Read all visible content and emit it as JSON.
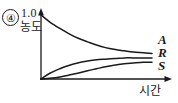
{
  "figure": {
    "option_number": "④",
    "y_axis": {
      "max_value_label": "1.0",
      "title": "농도"
    },
    "x_axis": {
      "title": "시간"
    },
    "curve_labels": {
      "a": "A",
      "r": "R",
      "s": "S"
    },
    "colors": {
      "ink": "#1a1a1a",
      "background": "#ffffff"
    }
  },
  "chart_data": {
    "type": "line",
    "title": "",
    "xlabel": "시간",
    "ylabel": "농도",
    "xlim": [
      0,
      1
    ],
    "ylim": [
      0,
      1
    ],
    "grid": false,
    "legend": "right-of-curve-ends",
    "annotations": [
      "④",
      "1.0"
    ],
    "axis_ticks": {
      "y": [
        "1.0"
      ],
      "x": []
    },
    "series": [
      {
        "name": "A",
        "description": "reactant concentration decaying from 1.0 to a plateau near 0.4",
        "x": [
          0.0,
          0.08,
          0.17,
          0.25,
          0.33,
          0.42,
          0.5,
          0.58,
          0.67,
          0.75,
          0.83,
          0.92,
          1.0
        ],
        "values": [
          1.0,
          0.89,
          0.79,
          0.71,
          0.64,
          0.58,
          0.53,
          0.49,
          0.46,
          0.44,
          0.42,
          0.41,
          0.4
        ]
      },
      {
        "name": "R",
        "description": "intermediate/product rising quickly from 0 to a plateau near 0.33",
        "x": [
          0.0,
          0.08,
          0.17,
          0.25,
          0.33,
          0.42,
          0.5,
          0.58,
          0.67,
          0.75,
          0.83,
          0.92,
          1.0
        ],
        "values": [
          0.0,
          0.09,
          0.16,
          0.21,
          0.25,
          0.28,
          0.3,
          0.31,
          0.32,
          0.33,
          0.33,
          0.33,
          0.33
        ]
      },
      {
        "name": "S",
        "description": "product rising slowly with an S-shape from 0 to near 0.26",
        "x": [
          0.0,
          0.08,
          0.17,
          0.25,
          0.33,
          0.42,
          0.5,
          0.58,
          0.67,
          0.75,
          0.83,
          0.92,
          1.0
        ],
        "values": [
          0.0,
          0.01,
          0.03,
          0.06,
          0.09,
          0.13,
          0.16,
          0.19,
          0.22,
          0.24,
          0.25,
          0.26,
          0.26
        ]
      }
    ]
  }
}
